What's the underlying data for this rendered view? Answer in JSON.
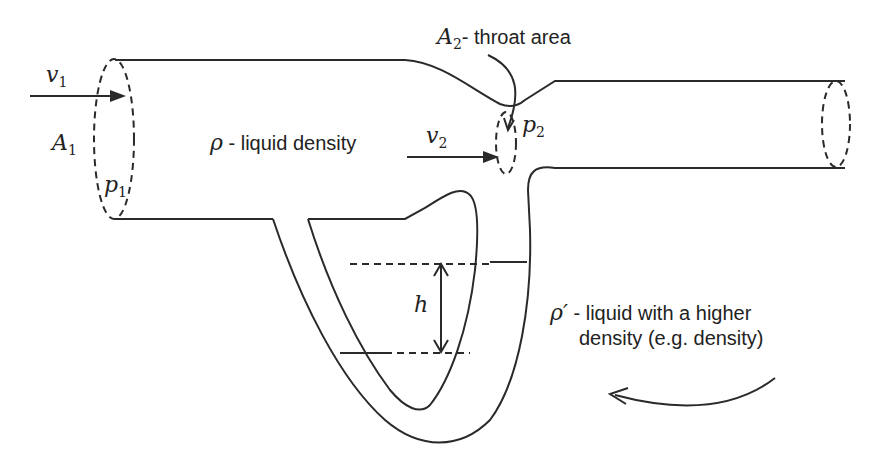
{
  "diagram": {
    "labels": {
      "v1": {
        "symbol": "v",
        "sub": "1"
      },
      "A1": {
        "symbol": "A",
        "sub": "1"
      },
      "p1": {
        "symbol": "p",
        "sub": "1"
      },
      "v2": {
        "symbol": "v",
        "sub": "2"
      },
      "p2": {
        "symbol": "p",
        "sub": "2"
      },
      "A2": {
        "symbol": "A",
        "sub": "2",
        "text": "- throat area"
      },
      "rho": {
        "symbol": "ρ",
        "text": " - liquid density"
      },
      "rho_prime": {
        "symbol": "ρ′",
        "text": " - liquid with a higher",
        "text2": "density (e.g. density)"
      },
      "h": {
        "symbol": "h"
      }
    },
    "colors": {
      "stroke": "#2a2a2a",
      "background": "#ffffff"
    }
  }
}
